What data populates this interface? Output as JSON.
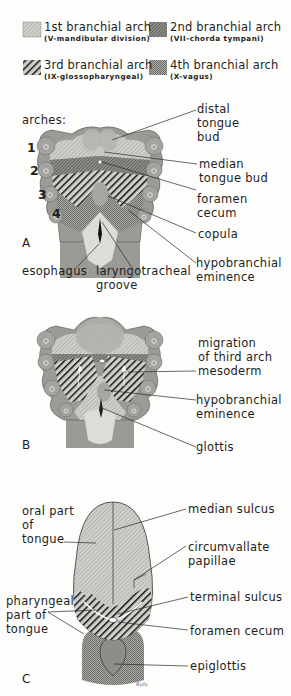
{
  "legend": [
    {
      "title": "1st branchial arch",
      "sub": "(V-mandibular division)",
      "pattern": "arch1"
    },
    {
      "title": "2nd branchial arch",
      "sub": "(VII-chorda tympani)",
      "pattern": "arch2"
    },
    {
      "title": "3rd branchial arch",
      "sub": "(IX-glossopharyngeal)",
      "pattern": "arch3"
    },
    {
      "title": "4th branchial arch",
      "sub": "(X-vagus)",
      "pattern": "arch4"
    }
  ],
  "colors": {
    "tissue_gray": "#9a9a96",
    "arch1_fill": "#c4c4c0",
    "arch2_fill": "#7a7a76",
    "arch3_fill": "#1a1a1a",
    "arch4_fill": "#8c8c88",
    "lumen_fill": "#dcdcd8",
    "line": "#2a2a2a"
  },
  "panelA": {
    "letter": "A",
    "arches_heading": "arches:",
    "arch_numbers": [
      "1",
      "2",
      "3",
      "4"
    ],
    "labels": {
      "distal_tongue_bud": "distal\ntongue\nbud",
      "median_tongue_bud": "median\ntongue bud",
      "foramen_cecum": "foramen\ncecum",
      "copula": "copula",
      "hypobranchial_eminence": "hypobranchial\neminence",
      "esophagus": "esophagus",
      "laryngotracheal_groove": "laryngotracheal\ngroove"
    }
  },
  "panelB": {
    "letter": "B",
    "labels": {
      "migration": "migration\nof third arch\nmesoderm",
      "hypobranchial_eminence": "hypobranchial\neminence",
      "glottis": "glottis"
    }
  },
  "panelC": {
    "letter": "C",
    "labels": {
      "oral_part": "oral part\nof\ntongue",
      "median_sulcus": "median sulcus",
      "circumvallate_papillae": "circumvallate\npapillae",
      "terminal_sulcus": "terminal sulcus",
      "pharyngeal_part": "pharyngeal\npart of\ntongue",
      "foramen_cecum": "foramen cecum",
      "epiglottis": "epiglottis"
    },
    "signature": "Rufu"
  }
}
